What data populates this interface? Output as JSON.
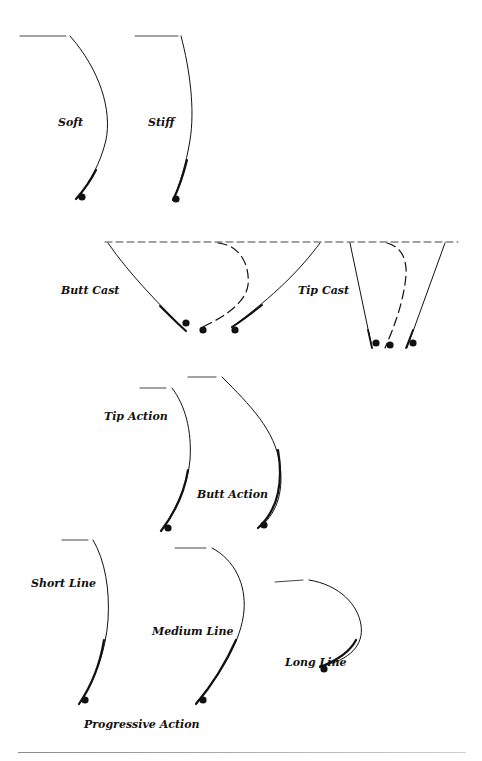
{
  "diagram": {
    "colors": {
      "ink": "#111111",
      "background": "#ffffff",
      "rule": "#9a9a9a"
    },
    "sections": [
      {
        "id": "flex",
        "labels": {
          "soft": "Soft",
          "stiff": "Stiff"
        }
      },
      {
        "id": "cast",
        "labels": {
          "butt_cast": "Butt Cast",
          "tip_cast": "Tip Cast"
        }
      },
      {
        "id": "action",
        "labels": {
          "tip_action": "Tip Action",
          "butt_action": "Butt Action"
        }
      },
      {
        "id": "progressive",
        "labels": {
          "short_line": "Short Line",
          "medium_line": "Medium Line",
          "long_line": "Long Line",
          "caption": "Progressive Action"
        }
      }
    ]
  }
}
